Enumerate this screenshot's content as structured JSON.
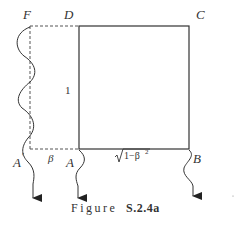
{
  "figure": {
    "labels": {
      "F": "F",
      "D": "D",
      "C": "C",
      "A_prime": "A",
      "A_prime_mark": "′",
      "beta": "β",
      "A": "A",
      "B": "B",
      "one": "1",
      "sqrt_expr": "1−β",
      "sqrt_exp": "2"
    },
    "caption": {
      "prefix": "Figure",
      "number": "S.2.4a"
    },
    "colors": {
      "line": "#333333",
      "dashed": "#555555"
    }
  }
}
